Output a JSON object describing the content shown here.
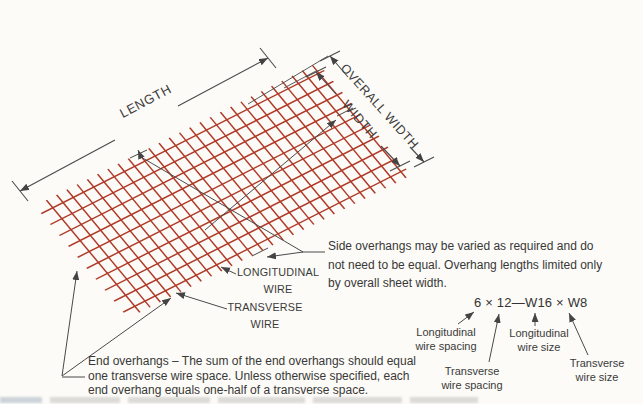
{
  "figure": {
    "dimension_labels": {
      "length": "LENGTH",
      "overall_width": "OVERALL WIDTH",
      "width": "WIDTH"
    },
    "wire_labels": {
      "longitudinal": {
        "line1": "LONGITUDINAL",
        "line2": "WIRE"
      },
      "transverse": {
        "line1": "TRANSVERSE",
        "line2": "WIRE"
      }
    },
    "notes": {
      "side": {
        "line1": "Side overhangs may be varied as required and do",
        "line2": "not need to be equal. Overhang lengths limited only",
        "line3": "by overall sheet width."
      },
      "end": {
        "line1": "End overhangs – The sum of the end overhangs should equal",
        "line2": "one transverse wire space. Unless otherwise specified, each",
        "line3": "end overhang equals one-half of a transverse space."
      }
    },
    "designation": {
      "code": "6 × 12—W16 × W8",
      "labels": {
        "longitudinal_spacing": {
          "line1": "Longitudinal",
          "line2": "wire spacing"
        },
        "transverse_spacing": {
          "line1": "Transverse",
          "line2": "wire spacing"
        },
        "longitudinal_size": {
          "line1": "Longitudinal",
          "line2": "wire size"
        },
        "transverse_size": {
          "line1": "Transverse",
          "line2": "wire size"
        }
      }
    },
    "mesh": {
      "transverse_wire_count": 27,
      "longitudinal_wire_count": 10
    },
    "colors": {
      "wire": "#b03927",
      "annotation": "#4a4a4a",
      "text": "#3a3a3a",
      "background": "#fcfbf7"
    }
  }
}
